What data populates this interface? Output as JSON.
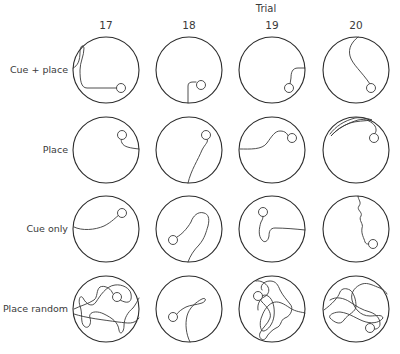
{
  "figure": {
    "column_axis_title": "Trial",
    "columns": [
      {
        "label": "17",
        "cx": 106
      },
      {
        "label": "18",
        "cx": 189
      },
      {
        "label": "19",
        "cx": 272
      },
      {
        "label": "20",
        "cx": 356
      }
    ],
    "rows": [
      {
        "label": "Cue + place",
        "cy": 70
      },
      {
        "label": "Place",
        "cy": 150
      },
      {
        "label": "Cue only",
        "cy": 229
      },
      {
        "label": "Place random",
        "cy": 309
      }
    ],
    "pool_radius": 33,
    "platform_radius": 4.5,
    "colors": {
      "stroke": "#2e2e2e",
      "text": "#3a3a3a",
      "background": "#ffffff"
    }
  }
}
